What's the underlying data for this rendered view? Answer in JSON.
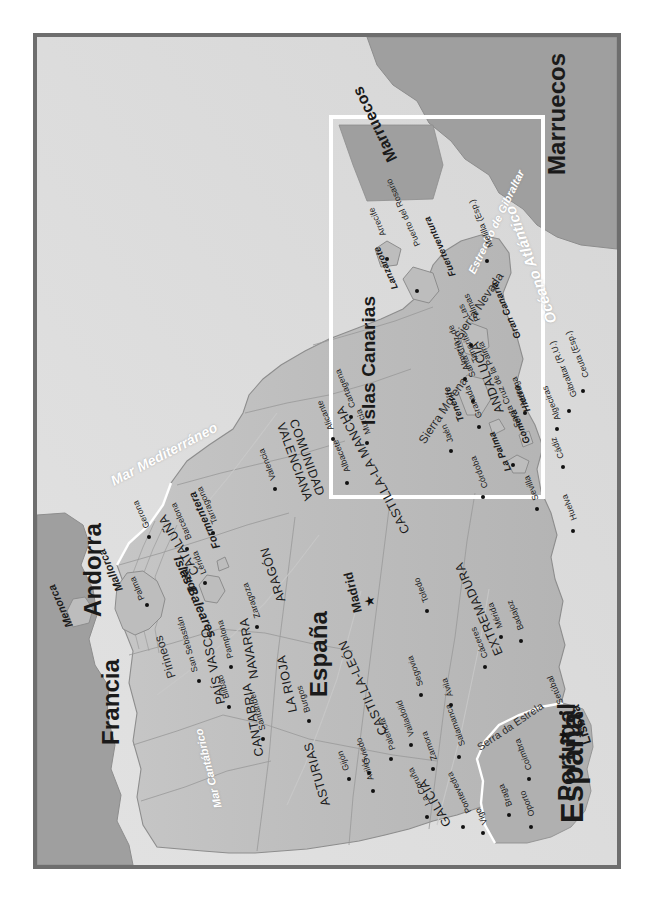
{
  "map": {
    "title": "España",
    "frame_color": "#6e6e6e",
    "land_color": "#bfbfbf",
    "sea_color": "#dcdcdc",
    "inset_border_color": "#ffffff"
  },
  "countries": [
    {
      "name": "España",
      "size": "title"
    },
    {
      "name": "Portugal",
      "size": "big"
    },
    {
      "name": "Francia",
      "size": "big"
    },
    {
      "name": "Andorra",
      "size": "big"
    },
    {
      "name": "Marruecos",
      "size": "big"
    },
    {
      "name": "Marruecos",
      "size": "small"
    }
  ],
  "water_bodies": [
    {
      "name": "Océano Atlántico"
    },
    {
      "name": "Mar Mediterráneo"
    },
    {
      "name": "Mar Cantábrico"
    },
    {
      "name": "Océano Atlántico"
    },
    {
      "name": "Estrecho de Gibraltar"
    }
  ],
  "regions": [
    {
      "name": "GALICIA"
    },
    {
      "name": "ASTURIAS"
    },
    {
      "name": "CANTABRIA"
    },
    {
      "name": "PAÍS VASCO"
    },
    {
      "name": "NAVARRA"
    },
    {
      "name": "LA RIOJA"
    },
    {
      "name": "ARAGÓN"
    },
    {
      "name": "CATALUÑA"
    },
    {
      "name": "CASTILLA-LEÓN"
    },
    {
      "name": "COMUNIDAD VALENCIANA"
    },
    {
      "name": "CASTILLA-LA MANCHA"
    },
    {
      "name": "EXTREMADURA"
    },
    {
      "name": "ANDALUCÍA"
    }
  ],
  "mountains": [
    {
      "name": "Pirineos"
    },
    {
      "name": "Sierra Morena"
    },
    {
      "name": "Sierra Nevada"
    },
    {
      "name": "Serra da Estrela"
    }
  ],
  "capitals": [
    {
      "name": "Madrid"
    },
    {
      "name": "Lisboa"
    }
  ],
  "cities": [
    {
      "name": "La Coruña"
    },
    {
      "name": "Pontevedra"
    },
    {
      "name": "Vigo"
    },
    {
      "name": "Avilés"
    },
    {
      "name": "Gijón"
    },
    {
      "name": "Oviedo"
    },
    {
      "name": "Santander"
    },
    {
      "name": "Bilbao"
    },
    {
      "name": "San Sebastián"
    },
    {
      "name": "Pamplona"
    },
    {
      "name": "Burgos"
    },
    {
      "name": "Palencia"
    },
    {
      "name": "Valladolid"
    },
    {
      "name": "Zamora"
    },
    {
      "name": "Salamanca"
    },
    {
      "name": "Segovia"
    },
    {
      "name": "Ávila"
    },
    {
      "name": "Zaragoza"
    },
    {
      "name": "Lérida"
    },
    {
      "name": "Gerona"
    },
    {
      "name": "Barcelona"
    },
    {
      "name": "Tarragona"
    },
    {
      "name": "Valencia"
    },
    {
      "name": "Alicante"
    },
    {
      "name": "Albacete"
    },
    {
      "name": "Murcia"
    },
    {
      "name": "Cartagena"
    },
    {
      "name": "Toledo"
    },
    {
      "name": "Cáceres"
    },
    {
      "name": "Mérida"
    },
    {
      "name": "Badajoz"
    },
    {
      "name": "Córdoba"
    },
    {
      "name": "Jaén"
    },
    {
      "name": "Granada"
    },
    {
      "name": "Almería"
    },
    {
      "name": "Málaga"
    },
    {
      "name": "Sevilla"
    },
    {
      "name": "Huelva"
    },
    {
      "name": "Cádiz"
    },
    {
      "name": "Algeciras"
    },
    {
      "name": "Gibraltar (R.U.)"
    },
    {
      "name": "Ceuta (Esp.)"
    },
    {
      "name": "Melilla (Esp.)"
    },
    {
      "name": "Braga"
    },
    {
      "name": "Oporto"
    },
    {
      "name": "Coimbra"
    },
    {
      "name": "Setúbal"
    }
  ],
  "balearics": {
    "group_label": "Islas Baleares",
    "islands": [
      {
        "name": "Menorca"
      },
      {
        "name": "Mallorca"
      },
      {
        "name": "Ibiza"
      },
      {
        "name": "Formentera"
      }
    ],
    "cities": [
      {
        "name": "Palma"
      }
    ]
  },
  "canaries": {
    "title": "Islas Canarias",
    "ocean": "Océano Atlántico",
    "neighbour": "Marruecos",
    "islands": [
      {
        "name": "La Palma"
      },
      {
        "name": "Tenerife"
      },
      {
        "name": "Gomera"
      },
      {
        "name": "Hierro"
      },
      {
        "name": "Gran Canaria"
      },
      {
        "name": "Fuerteventura"
      },
      {
        "name": "Lanzarote"
      }
    ],
    "cities": [
      {
        "name": "Santa Cruz de la Palma"
      },
      {
        "name": "Santa Cruz de Tenerife"
      },
      {
        "name": "Las Palmas"
      },
      {
        "name": "Puerto del Rosario"
      },
      {
        "name": "Arrecife"
      }
    ]
  },
  "compass": {
    "north": "N",
    "south": "S",
    "east": "E",
    "west": "O"
  }
}
